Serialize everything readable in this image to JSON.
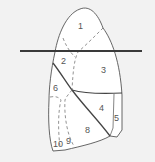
{
  "diagram": {
    "colors": {
      "background": "#f2f2f2",
      "lung_fill": "#ffffff",
      "outline": "#555555",
      "fissure": "#444444",
      "cut_line": "#3a3a3a",
      "dashed": "#777777",
      "label": "#555555"
    },
    "segments": [
      {
        "id": "1",
        "label": "1",
        "x": 81,
        "y": 29
      },
      {
        "id": "2",
        "label": "2",
        "x": 64,
        "y": 64
      },
      {
        "id": "3",
        "label": "3",
        "x": 104,
        "y": 73
      },
      {
        "id": "4",
        "label": "4",
        "x": 102,
        "y": 111
      },
      {
        "id": "5",
        "label": "5",
        "x": 117,
        "y": 121
      },
      {
        "id": "6",
        "label": "6",
        "x": 56,
        "y": 91
      },
      {
        "id": "8",
        "label": "8",
        "x": 88,
        "y": 133
      },
      {
        "id": "9",
        "label": "9",
        "x": 69,
        "y": 144
      },
      {
        "id": "10",
        "label": "10",
        "x": 57,
        "y": 147
      }
    ],
    "cut_line": {
      "x1": 20,
      "y1": 51,
      "x2": 142,
      "y2": 51
    }
  }
}
